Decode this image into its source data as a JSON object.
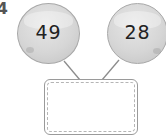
{
  "question": {
    "number_partial": "4"
  },
  "bubbles": [
    {
      "value": "49"
    },
    {
      "value": "28"
    }
  ],
  "answer_box": {
    "value": "",
    "placeholder": ""
  },
  "colors": {
    "bubble_fill": "#d6d6d6",
    "bubble_border": "#a8a8a8",
    "line": "#8c8c8c",
    "box_border": "#9a9a9a",
    "text": "#222222"
  }
}
